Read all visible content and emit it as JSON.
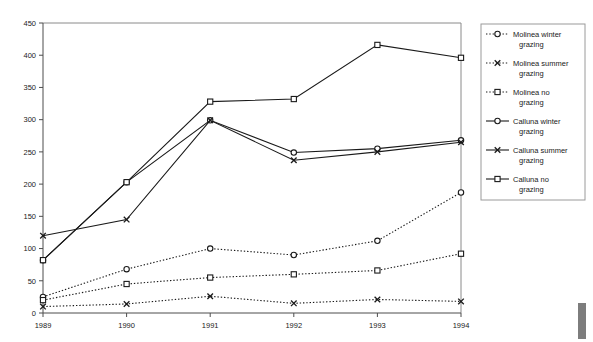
{
  "chart_data": {
    "type": "line",
    "title": "",
    "xlabel": "",
    "ylabel": "",
    "categories": [
      "1989",
      "1990",
      "1991",
      "1992",
      "1993",
      "1994"
    ],
    "x": [
      1989,
      1990,
      1991,
      1992,
      1993,
      1994
    ],
    "ylim": [
      0,
      450
    ],
    "yticks": [
      0,
      50,
      100,
      150,
      200,
      250,
      300,
      350,
      400,
      450
    ],
    "ytick_labels": [
      "0",
      "50",
      "100",
      "150",
      "200",
      "250",
      "300",
      "350",
      "400",
      "450"
    ],
    "grid": false,
    "legend_position": "right",
    "series": [
      {
        "name": "Molinea winter grazing",
        "marker": "circle",
        "line_style": "dotted",
        "values": [
          25,
          68,
          100,
          90,
          112,
          187
        ]
      },
      {
        "name": "Molinea summer grazing",
        "marker": "cross",
        "line_style": "dotted",
        "values": [
          10,
          14,
          26,
          15,
          21,
          18
        ]
      },
      {
        "name": "Molinea no grazing",
        "marker": "square",
        "line_style": "dotted",
        "values": [
          20,
          45,
          55,
          60,
          66,
          92
        ]
      },
      {
        "name": "Calluna winter grazing",
        "marker": "circle",
        "line_style": "solid",
        "values": [
          82,
          203,
          299,
          249,
          255,
          268
        ]
      },
      {
        "name": "Calluna summer grazing",
        "marker": "cross",
        "line_style": "solid",
        "values": [
          120,
          145,
          299,
          237,
          250,
          265
        ]
      },
      {
        "name": "Calluna no grazing",
        "marker": "square",
        "line_style": "solid",
        "values": [
          82,
          203,
          328,
          332,
          416,
          396
        ]
      }
    ]
  },
  "legend": {
    "entries": [
      {
        "label": "Molinea winter grazing"
      },
      {
        "label": "Molinea summer grazing"
      },
      {
        "label": "Molinea no grazing"
      },
      {
        "label": "Calluna winter grazing"
      },
      {
        "label": "Calluna summer grazing"
      },
      {
        "label": "Calluna no grazing"
      }
    ]
  },
  "colors": {
    "line": "#1a1a1a",
    "axis": "#4d4d4d",
    "border": "#8a8a8a",
    "background": "#ffffff"
  }
}
